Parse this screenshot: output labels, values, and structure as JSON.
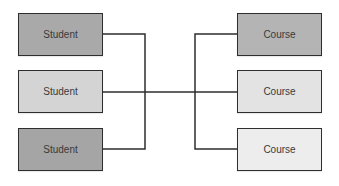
{
  "diagram": {
    "type": "relationship-diagram",
    "left_column": {
      "entity": "Student",
      "boxes": [
        {
          "label": "Student",
          "fill": "#a9a9a9"
        },
        {
          "label": "Student",
          "fill": "#d4d4d4"
        },
        {
          "label": "Student",
          "fill": "#a5a5a5"
        }
      ]
    },
    "right_column": {
      "entity": "Course",
      "boxes": [
        {
          "label": "Course",
          "fill": "#b4b4b4"
        },
        {
          "label": "Course",
          "fill": "#e3e3e3"
        },
        {
          "label": "Course",
          "fill": "#ededed"
        }
      ]
    },
    "connector": {
      "description": "Each Student box joins a left bracket, each Course box joins a right bracket; the two brackets are linked by a central horizontal line (many-to-many).",
      "stroke": "#2e2e2e"
    }
  }
}
